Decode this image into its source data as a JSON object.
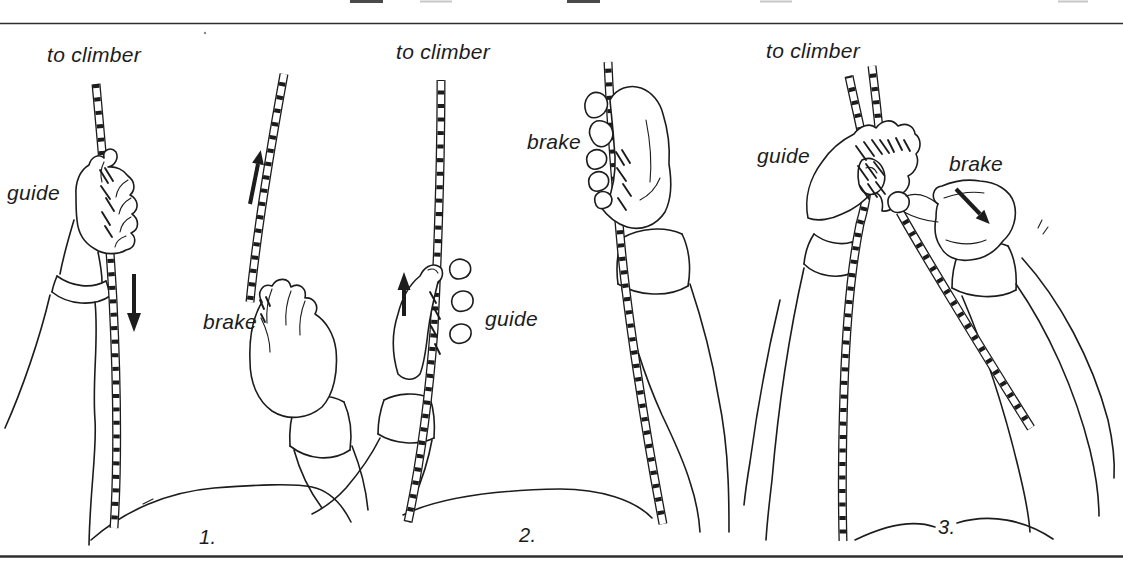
{
  "illustration": {
    "background_color": "#ffffff",
    "ink_color": "#1c1c1c",
    "subject": "belay rope handling sequence, three steps",
    "panels": [
      {
        "step_number": "1.",
        "to_climber_label": "to climber",
        "guide_label": "guide",
        "brake_label": "brake",
        "guide_rope_arrow": "down",
        "brake_rope_arrow": "up"
      },
      {
        "step_number": "2.",
        "to_climber_label": "to climber",
        "guide_label": "guide",
        "brake_label": "brake",
        "guide_rope_arrow": "up",
        "brake_rope_arrow": "none"
      },
      {
        "step_number": "3.",
        "to_climber_label": "to climber",
        "guide_label": "guide",
        "brake_label": "brake",
        "guide_rope_arrow": "none",
        "brake_rope_arrow": "down-right"
      }
    ]
  }
}
